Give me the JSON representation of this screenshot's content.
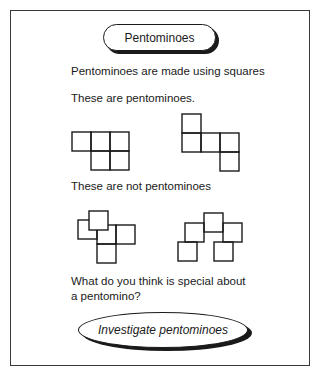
{
  "title": "Pentominoes",
  "intro": "Pentominoes are made using squares",
  "examples_label": "These are pentominoes.",
  "non_examples_label": "These are not pentominoes",
  "question_line1": "What do you think is special about",
  "question_line2": "a pentomino?",
  "action_label": "Investigate pentominoes",
  "colors": {
    "ink": "#1a1a1a",
    "frame": "#3a3a3a",
    "background": "#ffffff"
  },
  "figures": {
    "pentominoes": [
      {
        "name": "pentomino-p-shape",
        "cells": 5
      },
      {
        "name": "pentomino-s-shape",
        "cells": 5
      }
    ],
    "non_pentominoes": [
      {
        "name": "non-pentomino-overlapping-squares",
        "cells": 5
      },
      {
        "name": "non-pentomino-corner-touching-squares",
        "cells": 5
      }
    ]
  }
}
